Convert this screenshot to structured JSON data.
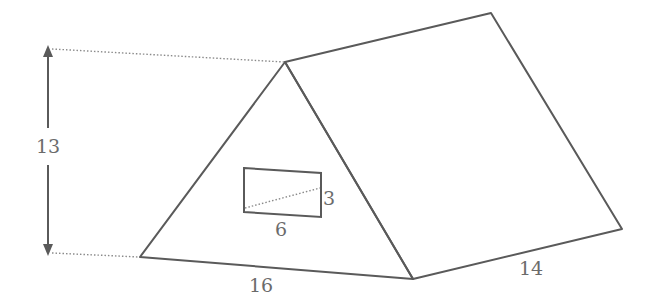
{
  "diagram": {
    "type": "triangular-prism",
    "colors": {
      "edge": "#5a5a5a",
      "dotted": "#8a8a8a",
      "label": "#6b6b6b",
      "background": "#ffffff"
    },
    "labels": {
      "height": "13",
      "base": "16",
      "length": "14",
      "window_width": "6",
      "window_height": "3"
    }
  }
}
